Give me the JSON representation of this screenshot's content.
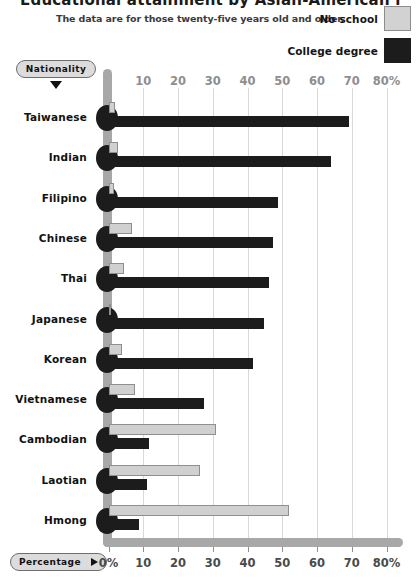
{
  "header": {
    "title": "Educational attainment by Asian-American nationality",
    "subtitle": "The data are for those twenty-five years old and older."
  },
  "legend": {
    "items": [
      {
        "label": "No school",
        "swatch": "light-grey-swatch",
        "color": "#d2d2d2"
      },
      {
        "label": "College degree",
        "swatch": "black-swatch",
        "color": "#1c1c1c"
      }
    ]
  },
  "controls": {
    "nationality": {
      "label": "Nationality",
      "icon": "caret-down-icon"
    },
    "percentage": {
      "label": "Percentage",
      "icon": "caret-right-icon"
    }
  },
  "chart_data": {
    "type": "bar",
    "orientation": "horizontal",
    "title": "Educational attainment by Asian-American nationality",
    "subtitle": "The data are for those twenty-five years old and older.",
    "xlabel": "Percentage",
    "ylabel": "Nationality",
    "xlim": [
      0,
      80
    ],
    "xticks": [
      0,
      10,
      20,
      30,
      40,
      50,
      60,
      70,
      80
    ],
    "xticklabels_bottom": [
      "0%",
      "10",
      "20",
      "30",
      "40",
      "50",
      "60",
      "70",
      "80%"
    ],
    "xticklabels_top": [
      "",
      "10",
      "20",
      "30",
      "40",
      "50",
      "60",
      "70",
      "80%"
    ],
    "grid": true,
    "legend_position": "top-right",
    "categories": [
      "Taiwanese",
      "Indian",
      "Filipino",
      "Chinese",
      "Thai",
      "Japanese",
      "Korean",
      "Vietnamese",
      "Cambodian",
      "Laotian",
      "Hmong"
    ],
    "series": [
      {
        "name": "No school",
        "color": "#d2d2d2",
        "values": [
          1.8,
          2.8,
          1.5,
          6.9,
          4.6,
          0.7,
          4.0,
          7.6,
          30.8,
          26.3,
          51.8
        ]
      },
      {
        "name": "College degree",
        "color": "#1c1c1c",
        "values": [
          69.2,
          64.0,
          48.8,
          47.4,
          46.2,
          44.8,
          41.6,
          27.5,
          11.6,
          11.0,
          8.8
        ]
      }
    ]
  }
}
